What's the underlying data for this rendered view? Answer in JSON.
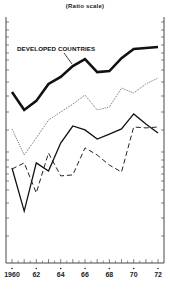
{
  "chart_data": {
    "type": "line",
    "title": "",
    "subtitle": "(Ratio scale)",
    "xlabel": "",
    "ylabel": "",
    "y_scale": "log (ratio scale), no tick labels; values are relative plotted height 0-100 (bottom-top of frame)",
    "x": [
      1960,
      1961,
      1962,
      1963,
      1964,
      1965,
      1966,
      1967,
      1968,
      1969,
      1970,
      1971,
      1972
    ],
    "x_tick_labels": [
      "1960",
      "62",
      "64",
      "66",
      "68",
      "70",
      "72"
    ],
    "grid": false,
    "legend": "inline label with leader line",
    "series": [
      {
        "name": "DEVELOPED COUNTRIES",
        "style": "thick-solid",
        "values": [
          69.5,
          62.2,
          65.9,
          72.8,
          75.6,
          80.1,
          82.9,
          77.6,
          78.0,
          83.3,
          87.0,
          87.4,
          87.8
        ]
      },
      {
        "name": "Series 2 (unlabeled)",
        "style": "dotted",
        "values": [
          54.5,
          43.9,
          50.8,
          58.1,
          61.4,
          64.6,
          68.3,
          62.2,
          63.4,
          71.1,
          69.1,
          72.8,
          75.2
        ]
      },
      {
        "name": "Series 3 (unlabeled)",
        "style": "thin-solid",
        "values": [
          38.6,
          21.1,
          40.7,
          37.4,
          48.8,
          55.7,
          54.1,
          50.4,
          52.4,
          54.5,
          60.6,
          56.5,
          52.8
        ]
      },
      {
        "name": "Series 4 (unlabeled)",
        "style": "dashed",
        "values": [
          38.2,
          40.7,
          28.5,
          44.7,
          35.4,
          35.8,
          46.8,
          43.9,
          39.8,
          37.0,
          55.3,
          54.9,
          55.3
        ]
      }
    ]
  },
  "labels": {
    "subtitle": "(Ratio scale)",
    "developed": "DEVELOPED COUNTRIES"
  },
  "x_axis": [
    {
      "label": "1960",
      "year": 1960
    },
    {
      "label": "62",
      "year": 1962
    },
    {
      "label": "64",
      "year": 1964
    },
    {
      "label": "66",
      "year": 1966
    },
    {
      "label": "68",
      "year": 1968
    },
    {
      "label": "70",
      "year": 1970
    },
    {
      "label": "72",
      "year": 1972
    }
  ],
  "colors": {
    "ink": "#1a1a1a",
    "background": "#ffffff"
  }
}
